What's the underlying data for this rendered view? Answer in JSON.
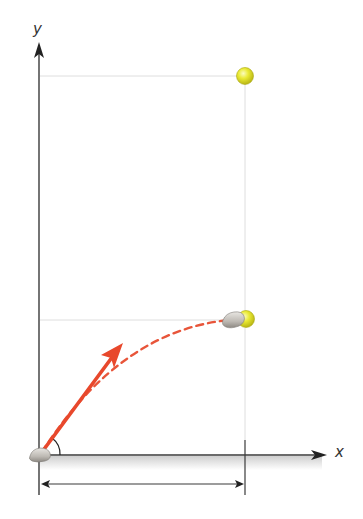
{
  "diagram": {
    "type": "projectile-motion",
    "axes": {
      "x_label": "x",
      "y_label": "y"
    },
    "elements": {
      "launch_angle_arc": "angle",
      "launch_velocity_arrow": "initial velocity",
      "trajectory": "parabolic path (dashed)",
      "projectile": "rock",
      "target": "ball (drop position and hit position)",
      "range_marker": "horizontal distance"
    },
    "colors": {
      "axis": "#3a3a3a",
      "arrow": "#e8482c",
      "trajectory": "#e8553a",
      "ball": "#e6e62a",
      "ball_highlight": "#f6f7a0",
      "rock": "#c8c5c0",
      "guide": "#dcdcdc",
      "ground": "#d9d9d9"
    }
  }
}
